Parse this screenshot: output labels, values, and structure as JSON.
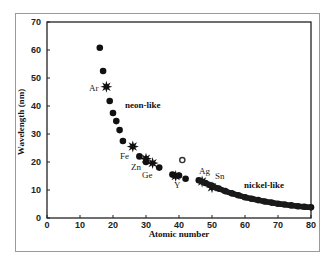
{
  "chart_data": {
    "type": "scatter",
    "title": "",
    "xlabel": "Atomic number",
    "ylabel": "Wavelength (nm)",
    "xlim": [
      0,
      80
    ],
    "ylim": [
      0,
      70
    ],
    "x_ticks": [
      0,
      10,
      20,
      30,
      40,
      50,
      60,
      70,
      80
    ],
    "y_ticks": [
      0,
      10,
      20,
      30,
      40,
      50,
      60,
      70
    ],
    "grid": false,
    "legend": null,
    "series": [
      {
        "name": "neon-like (diamonds)",
        "marker": "diamond",
        "points": [
          {
            "x": 16,
            "y": 60.8
          },
          {
            "x": 17,
            "y": 52.5
          },
          {
            "x": 19,
            "y": 41.8
          },
          {
            "x": 20,
            "y": 37.5
          },
          {
            "x": 21,
            "y": 34.6
          },
          {
            "x": 22,
            "y": 31.4
          },
          {
            "x": 23,
            "y": 27.5
          },
          {
            "x": 28,
            "y": 22.0
          },
          {
            "x": 30,
            "y": 20.0
          },
          {
            "x": 34,
            "y": 18.0
          }
        ]
      },
      {
        "name": "neon-like lasing (stars)",
        "marker": "star",
        "points": [
          {
            "x": 18,
            "y": 46.9,
            "label": "Ar"
          },
          {
            "x": 26,
            "y": 25.5,
            "label": "Fe"
          },
          {
            "x": 30,
            "y": 21.2,
            "label": "Zn"
          },
          {
            "x": 32,
            "y": 19.6,
            "label": "Ge"
          }
        ]
      },
      {
        "name": "nickel-like (diamonds)",
        "marker": "diamond",
        "points": [
          {
            "x": 38,
            "y": 15.5
          },
          {
            "x": 40,
            "y": 15.2
          },
          {
            "x": 42,
            "y": 14.0
          },
          {
            "x": 46,
            "y": 13.5
          },
          {
            "x": 48,
            "y": 12.5
          },
          {
            "x": 50,
            "y": 11.5
          },
          {
            "x": 52,
            "y": 10.5
          },
          {
            "x": 54,
            "y": 9.6
          },
          {
            "x": 56,
            "y": 8.8
          },
          {
            "x": 58,
            "y": 8.1
          },
          {
            "x": 60,
            "y": 7.4
          },
          {
            "x": 62,
            "y": 6.9
          },
          {
            "x": 64,
            "y": 6.4
          },
          {
            "x": 66,
            "y": 5.9
          },
          {
            "x": 68,
            "y": 5.5
          },
          {
            "x": 70,
            "y": 5.1
          },
          {
            "x": 72,
            "y": 4.8
          },
          {
            "x": 74,
            "y": 4.5
          },
          {
            "x": 76,
            "y": 4.2
          },
          {
            "x": 78,
            "y": 4.0
          },
          {
            "x": 80,
            "y": 3.8
          }
        ]
      },
      {
        "name": "nickel-like lasing (stars)",
        "marker": "star",
        "points": [
          {
            "x": 39,
            "y": 15.0,
            "label": "Y"
          },
          {
            "x": 47,
            "y": 13.0,
            "label": "Ag"
          },
          {
            "x": 50,
            "y": 11.0,
            "label": "Sn"
          }
        ]
      },
      {
        "name": "outlier (open circle)",
        "marker": "circle",
        "points": [
          {
            "x": 41,
            "y": 20.7
          }
        ]
      }
    ],
    "annotations": [
      {
        "text": "Ar",
        "x": 14.5,
        "y": 46.5
      },
      {
        "text": "neon-like",
        "x": 26,
        "y": 40
      },
      {
        "text": "Fe",
        "x": 23.5,
        "y": 22
      },
      {
        "text": "Zn",
        "x": 26.5,
        "y": 17.5
      },
      {
        "text": "Ge",
        "x": 29,
        "y": 15
      },
      {
        "text": "Y",
        "x": 39.2,
        "y": 11.5
      },
      {
        "text": "Ag",
        "x": 46.5,
        "y": 15.8
      },
      {
        "text": "Sn",
        "x": 51.5,
        "y": 14
      },
      {
        "text": "nickel-like",
        "x": 61.5,
        "y": 10
      }
    ]
  },
  "labels": {
    "xlabel": "Atomic number",
    "ylabel": "Wavelength (nm)",
    "neon_like": "neon-like",
    "nickel_like": "nickel-like",
    "ar": "Ar",
    "fe": "Fe",
    "zn": "Zn",
    "ge": "Ge",
    "y": "Y",
    "ag": "Ag",
    "sn": "Sn"
  }
}
